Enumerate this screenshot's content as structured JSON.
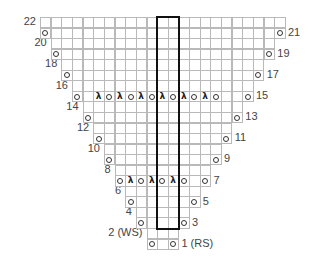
{
  "chart_title": "Knitting lace chart (triangle)",
  "grid": {
    "columns": 23,
    "rows": 22,
    "origin_x": 40,
    "origin_y": 17,
    "cell_w": 10.65,
    "cell_h": 10.55,
    "center_col": 12,
    "line_color": "#b9b9b9"
  },
  "legend_symbols": {
    "o": "yarn-over",
    "lambda": "sl1-k2tog-psso / decrease"
  },
  "rows": [
    {
      "row": 1,
      "side": "RS",
      "label": "1 (RS)",
      "label_side": "right",
      "start": 11,
      "end": 13,
      "symbols": {
        "11": "o",
        "13": "o"
      }
    },
    {
      "row": 2,
      "side": "WS",
      "label": "2 (WS)",
      "label_side": "left",
      "start": 11,
      "end": 13,
      "symbols": {}
    },
    {
      "row": 3,
      "label": "3",
      "label_side": "right",
      "start": 10,
      "end": 14,
      "symbols": {
        "10": "o",
        "14": "o"
      }
    },
    {
      "row": 4,
      "label": "4",
      "label_side": "left",
      "start": 10,
      "end": 14,
      "symbols": {}
    },
    {
      "row": 5,
      "label": "5",
      "label_side": "right",
      "start": 9,
      "end": 15,
      "symbols": {
        "9": "o",
        "15": "o"
      }
    },
    {
      "row": 6,
      "label": "6",
      "label_side": "left",
      "start": 9,
      "end": 15,
      "symbols": {}
    },
    {
      "row": 7,
      "label": "7",
      "label_side": "right",
      "start": 8,
      "end": 16,
      "symbols": {
        "8": "o",
        "9": "λ",
        "10": "o",
        "11": "λ",
        "12": "o",
        "13": "λ",
        "14": "o",
        "16": "o"
      }
    },
    {
      "row": 8,
      "label": "8",
      "label_side": "left",
      "start": 8,
      "end": 16,
      "symbols": {}
    },
    {
      "row": 9,
      "label": "9",
      "label_side": "right",
      "start": 7,
      "end": 17,
      "symbols": {
        "7": "o",
        "17": "o"
      }
    },
    {
      "row": 10,
      "label": "10",
      "label_side": "left",
      "start": 7,
      "end": 17,
      "symbols": {}
    },
    {
      "row": 11,
      "label": "11",
      "label_side": "right",
      "start": 6,
      "end": 18,
      "symbols": {
        "6": "o",
        "18": "o"
      }
    },
    {
      "row": 12,
      "label": "12",
      "label_side": "left",
      "start": 6,
      "end": 18,
      "symbols": {}
    },
    {
      "row": 13,
      "label": "13",
      "label_side": "right",
      "start": 5,
      "end": 19,
      "symbols": {
        "5": "o",
        "19": "o"
      }
    },
    {
      "row": 14,
      "label": "14",
      "label_side": "left",
      "start": 5,
      "end": 19,
      "symbols": {}
    },
    {
      "row": 15,
      "label": "15",
      "label_side": "right",
      "start": 4,
      "end": 20,
      "symbols": {
        "4": "o",
        "6": "λ",
        "7": "o",
        "8": "λ",
        "9": "o",
        "10": "λ",
        "11": "o",
        "12": "λ",
        "13": "o",
        "14": "λ",
        "15": "o",
        "16": "λ",
        "17": "o",
        "20": "o"
      }
    },
    {
      "row": 16,
      "label": "16",
      "label_side": "left",
      "start": 4,
      "end": 20,
      "symbols": {}
    },
    {
      "row": 17,
      "label": "17",
      "label_side": "right",
      "start": 3,
      "end": 21,
      "symbols": {
        "3": "o",
        "21": "o"
      }
    },
    {
      "row": 18,
      "label": "18",
      "label_side": "left",
      "start": 3,
      "end": 21,
      "symbols": {}
    },
    {
      "row": 19,
      "label": "19",
      "label_side": "right",
      "start": 2,
      "end": 22,
      "symbols": {
        "2": "o",
        "22": "o"
      }
    },
    {
      "row": 20,
      "label": "20",
      "label_side": "left",
      "start": 2,
      "end": 22,
      "symbols": {}
    },
    {
      "row": 21,
      "label": "21",
      "label_side": "right",
      "start": 1,
      "end": 23,
      "symbols": {
        "1": "o",
        "23": "o"
      }
    },
    {
      "row": 22,
      "label": "22",
      "label_side": "left",
      "start": 1,
      "end": 23,
      "symbols": {}
    }
  ],
  "repeat_box": {
    "col_start": 12,
    "col_end": 13,
    "row_top": 22,
    "row_bottom": 3,
    "border_color": "#111111"
  }
}
